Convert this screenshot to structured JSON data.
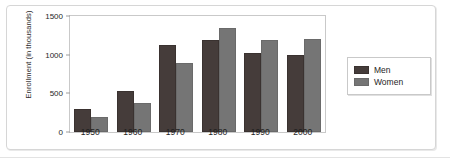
{
  "chart_data": {
    "type": "bar",
    "title": "",
    "xlabel": "",
    "ylabel": "Enrollment (in thousands)",
    "categories": [
      "1950",
      "1960",
      "1970",
      "1980",
      "1990",
      "2000"
    ],
    "series": [
      {
        "name": "Men",
        "color": "#453c3a",
        "values": [
          300,
          530,
          1130,
          1190,
          1020,
          990
        ]
      },
      {
        "name": "Women",
        "color": "#757575",
        "values": [
          190,
          370,
          890,
          1350,
          1190,
          1200
        ]
      }
    ],
    "ylim": [
      0,
      1500
    ],
    "yticks": [
      0,
      500,
      1000,
      1500
    ],
    "ytick_labels": [
      "0",
      "500",
      "1000",
      "1500"
    ],
    "grid": false,
    "legend_position": "right-outside",
    "legend_entries": [
      "Men",
      "Women"
    ]
  }
}
